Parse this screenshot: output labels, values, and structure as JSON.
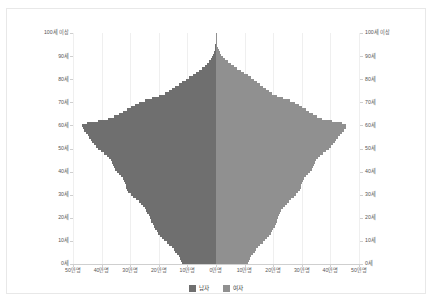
{
  "chart_data": {
    "type": "bar",
    "subtype": "population-pyramid",
    "title": "",
    "xlabel": "",
    "ylabel": "",
    "orientation": "horizontal",
    "grid": true,
    "legend_position": "bottom-center",
    "axis_unit": "만명",
    "age_unit": "세",
    "xlim": [
      -500000,
      500000
    ],
    "x_tick_labels_left": [
      "50만명",
      "40만명",
      "30만명",
      "20만명",
      "10만명",
      "0만명"
    ],
    "x_tick_labels_right": [
      "0만명",
      "10만명",
      "20만명",
      "30만명",
      "40만명",
      "50만명"
    ],
    "x_tick_values": [
      -500000,
      -400000,
      -300000,
      -200000,
      -100000,
      0,
      100000,
      200000,
      300000,
      400000,
      500000
    ],
    "y_tick_labels": [
      "100세 이상",
      "90세",
      "80세",
      "70세",
      "60세",
      "50세",
      "40세",
      "30세",
      "20세",
      "10세",
      "0세"
    ],
    "y_tick_values": [
      100,
      90,
      80,
      70,
      60,
      50,
      40,
      30,
      20,
      10,
      0
    ],
    "ylim": [
      0,
      100
    ],
    "categories": [
      0,
      1,
      2,
      3,
      4,
      5,
      6,
      7,
      8,
      9,
      10,
      11,
      12,
      13,
      14,
      15,
      16,
      17,
      18,
      19,
      20,
      21,
      22,
      23,
      24,
      25,
      26,
      27,
      28,
      29,
      30,
      31,
      32,
      33,
      34,
      35,
      36,
      37,
      38,
      39,
      40,
      41,
      42,
      43,
      44,
      45,
      46,
      47,
      48,
      49,
      50,
      51,
      52,
      53,
      54,
      55,
      56,
      57,
      58,
      59,
      60,
      61,
      62,
      63,
      64,
      65,
      66,
      67,
      68,
      69,
      70,
      71,
      72,
      73,
      74,
      75,
      76,
      77,
      78,
      79,
      80,
      81,
      82,
      83,
      84,
      85,
      86,
      87,
      88,
      89,
      90,
      91,
      92,
      93,
      94,
      95,
      96,
      97,
      98,
      99,
      100
    ],
    "series": [
      {
        "name": "남자",
        "color": "#6f6f6f",
        "side": "left",
        "values": [
          118000,
          122000,
          126000,
          131000,
          136000,
          142000,
          148000,
          155000,
          163000,
          172000,
          182000,
          190000,
          196000,
          202000,
          208000,
          213000,
          218000,
          222000,
          226000,
          229000,
          232000,
          236000,
          240000,
          244000,
          249000,
          255000,
          262000,
          270000,
          279000,
          289000,
          299000,
          306000,
          311000,
          314000,
          316000,
          318000,
          321000,
          325000,
          331000,
          338000,
          346000,
          352000,
          357000,
          361000,
          364000,
          368000,
          374000,
          382000,
          392000,
          402000,
          412000,
          420000,
          427000,
          433000,
          438000,
          443000,
          449000,
          456000,
          462000,
          466000,
          468000,
          452000,
          412000,
          378000,
          356000,
          340000,
          326000,
          312000,
          298000,
          284000,
          268000,
          248000,
          224000,
          200000,
          180000,
          166000,
          154000,
          142000,
          130000,
          118000,
          106000,
          94000,
          82000,
          70000,
          59000,
          48000,
          39000,
          31000,
          24000,
          18000,
          13500,
          9800,
          6800,
          4600,
          3000,
          1900,
          1150,
          680,
          390,
          210,
          260
        ]
      },
      {
        "name": "여자",
        "color": "#909090",
        "side": "right",
        "values": [
          112000,
          116000,
          120000,
          124000,
          129000,
          135000,
          141000,
          147000,
          155000,
          163000,
          172000,
          180000,
          186000,
          191000,
          196000,
          201000,
          205000,
          209000,
          212000,
          215000,
          218000,
          221000,
          225000,
          229000,
          234000,
          240000,
          247000,
          255000,
          263000,
          272000,
          281000,
          288000,
          293000,
          296000,
          298000,
          300000,
          303000,
          307000,
          313000,
          320000,
          328000,
          334000,
          339000,
          343000,
          346000,
          350000,
          356000,
          364000,
          374000,
          384000,
          394000,
          402000,
          409000,
          415000,
          420000,
          426000,
          433000,
          441000,
          448000,
          453000,
          456000,
          442000,
          404000,
          372000,
          352000,
          338000,
          326000,
          314000,
          302000,
          290000,
          276000,
          258000,
          236000,
          214000,
          196000,
          184000,
          174000,
          164000,
          154000,
          144000,
          133000,
          122000,
          111000,
          99000,
          87000,
          75000,
          63000,
          52000,
          42000,
          33000,
          25500,
          19000,
          13800,
          9800,
          6700,
          4400,
          2800,
          1700,
          1000,
          560,
          760
        ]
      }
    ]
  },
  "legend": {
    "items": [
      {
        "label": "남자",
        "color": "#6f6f6f"
      },
      {
        "label": "여자",
        "color": "#909090"
      }
    ]
  },
  "colors": {
    "male": "#6f6f6f",
    "female": "#909090",
    "grid": "#efefef",
    "axis": "#cfcfcf",
    "text": "#555555",
    "background": "#ffffff",
    "frame": "#e8e8e8"
  }
}
